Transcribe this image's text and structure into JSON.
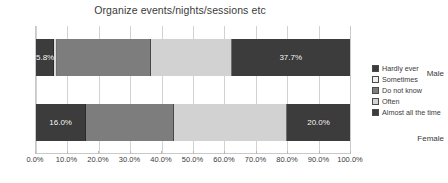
{
  "chart_data": {
    "type": "bar",
    "orientation": "horizontal",
    "stacked": true,
    "stack_mode": "percent",
    "title": "Organize events/nights/sessions etc",
    "xlabel": "",
    "ylabel": "",
    "categories": [
      "Male",
      "Female"
    ],
    "xlim": [
      0,
      100
    ],
    "xtick_labels": [
      "0.0%",
      "10.0%",
      "20.0%",
      "30.0%",
      "40.0%",
      "50.0%",
      "60.0%",
      "70.0%",
      "80.0%",
      "90.0%",
      "100.0%"
    ],
    "xtick_values": [
      0,
      10,
      20,
      30,
      40,
      50,
      60,
      70,
      80,
      90,
      100
    ],
    "grid": "vertical",
    "legend_position": "right",
    "series": [
      {
        "name": "Hardly ever",
        "color": "#3c3c3c",
        "values": [
          5.8,
          16.0
        ],
        "data_labels": [
          "5.8%",
          "16.0%"
        ]
      },
      {
        "name": "Sometimes",
        "color": "#d9d9d9",
        "values": [
          1.0,
          0.0
        ],
        "data_labels": [
          "",
          ""
        ]
      },
      {
        "name": "Do not know",
        "color": "#7d7d7d",
        "values": [
          29.7,
          27.8
        ],
        "data_labels": [
          "",
          ""
        ]
      },
      {
        "name": "Often",
        "color": "#d2d2d2",
        "values": [
          25.8,
          36.2
        ],
        "data_labels": [
          "",
          ""
        ]
      },
      {
        "name": "Almost all the time",
        "color": "#3c3c3c",
        "values": [
          37.7,
          20.0
        ],
        "data_labels": [
          "37.7%",
          "20.0%"
        ]
      }
    ]
  },
  "legend": {
    "items": [
      {
        "label": "Hardly ever",
        "color": "#3c3c3c"
      },
      {
        "label": "Sometimes",
        "color": "#efefef"
      },
      {
        "label": "Do not know",
        "color": "#7d7d7d"
      },
      {
        "label": "Often",
        "color": "#d2d2d2"
      },
      {
        "label": "Almost all the time",
        "color": "#3c3c3c"
      }
    ]
  },
  "colors": {
    "background": "#ffffff",
    "text": "#3a3a3a",
    "gridline": "#d2d2d2",
    "axis": "#c9c9c9",
    "data_label": "#ffffff"
  }
}
